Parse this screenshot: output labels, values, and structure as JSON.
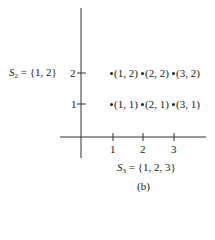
{
  "figure": {
    "caption": "(b)",
    "y_set": {
      "name": "S",
      "sub": "2",
      "rest": " = {1, 2}"
    },
    "x_set": {
      "name": "S",
      "sub": "3",
      "rest": " = {1, 2, 3}"
    },
    "x_ticks": [
      "1",
      "2",
      "3"
    ],
    "y_ticks": [
      "1",
      "2"
    ],
    "points": [
      {
        "label": "(1, 2)"
      },
      {
        "label": "(2, 2)"
      },
      {
        "label": "(3, 2)"
      },
      {
        "label": "(1, 1)"
      },
      {
        "label": "(2, 1)"
      },
      {
        "label": "(3, 1)"
      }
    ]
  }
}
